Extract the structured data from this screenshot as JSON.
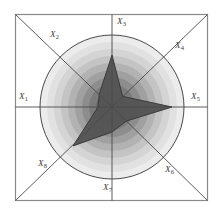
{
  "figure": {
    "type": "star-glyph-radar-plot",
    "background_color": "#ffffff",
    "frame_color": "#7a7a7a",
    "axis_color": "#4a4a4a",
    "circle_color": "#4a4a4a",
    "polygon_fill": "#545454",
    "polygon_stroke": "#3c3c3c"
  },
  "labels": {
    "x1": "X",
    "x1_sub": "1",
    "x2": "X",
    "x2_sub": "2",
    "x3": "X",
    "x3_sub": "3",
    "x4": "X",
    "x4_sub": "4",
    "x5": "X",
    "x5_sub": "5",
    "x6": "X",
    "x6_sub": "6",
    "x7": "X",
    "x7_sub": "7",
    "x8": "X",
    "x8_sub": "8"
  },
  "chart_data": {
    "type": "radar",
    "title": "",
    "xlabel": "",
    "ylabel": "",
    "legend": [],
    "grid": true,
    "center": {
      "x": 112,
      "y": 107
    },
    "max_radius": 72,
    "rlim": [
      0,
      1
    ],
    "axis_order_degrees": [
      180,
      135,
      90,
      45,
      0,
      315,
      270,
      225
    ],
    "categories": [
      "X1",
      "X2",
      "X3",
      "X4",
      "X5",
      "X6",
      "X7",
      "X8"
    ],
    "angles_deg": [
      180,
      135,
      90,
      45,
      0,
      315,
      270,
      225
    ],
    "values": [
      0.19,
      0.25,
      0.72,
      0.21,
      0.84,
      0.28,
      0.35,
      0.76
    ],
    "radii_px": [
      14,
      18,
      52,
      15,
      60,
      20,
      25,
      55
    ],
    "rings": [
      {
        "radius_px": 72,
        "color": "#ededed"
      },
      {
        "radius_px": 65,
        "color": "#e3e3e3"
      },
      {
        "radius_px": 58,
        "color": "#d6d6d6"
      },
      {
        "radius_px": 51,
        "color": "#c6c6c6"
      },
      {
        "radius_px": 44,
        "color": "#b4b4b4"
      },
      {
        "radius_px": 37,
        "color": "#a2a2a2"
      },
      {
        "radius_px": 30,
        "color": "#8e8e8e"
      },
      {
        "radius_px": 23,
        "color": "#7c7c7c"
      },
      {
        "radius_px": 16,
        "color": "#6a6a6a"
      },
      {
        "radius_px": 9,
        "color": "#5a5a5a"
      }
    ]
  }
}
